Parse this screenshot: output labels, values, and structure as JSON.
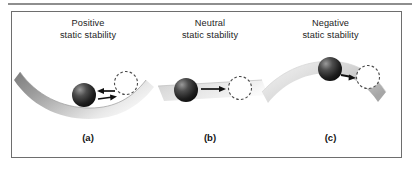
{
  "figure": {
    "kind": "static-stability-diagram",
    "background_color": "#ffffff",
    "frame_border_color": "#6e6e6e",
    "rule_color": "#8e8e8e",
    "panels": [
      {
        "id": "a",
        "caption": "(a)",
        "title_line1": "Positive",
        "title_line2": "static stability",
        "surface_shape": "concave",
        "surface_label": "valley",
        "ball_position": "bottom-of-valley",
        "displaced_position": "up-right-slope",
        "arrows": [
          {
            "direction": "left",
            "meaning": "restoring-toward-equilibrium"
          },
          {
            "direction": "right",
            "meaning": "displacement-from-equilibrium"
          }
        ],
        "ball_color": "#141414",
        "ball_highlight_color": "#8a8a8a",
        "dashed_circle_color": "#4a4a4a",
        "arrow_color": "#111111"
      },
      {
        "id": "b",
        "caption": "(b)",
        "title_line1": "Neutral",
        "title_line2": "static stability",
        "surface_shape": "flat",
        "surface_label": "level plane",
        "ball_position": "left",
        "displaced_position": "right",
        "arrows": [
          {
            "direction": "right",
            "meaning": "displacement-with-no-return"
          }
        ],
        "ball_color": "#141414",
        "ball_highlight_color": "#8a8a8a",
        "dashed_circle_color": "#4a4a4a",
        "arrow_color": "#111111"
      },
      {
        "id": "c",
        "caption": "(c)",
        "title_line1": "Negative",
        "title_line2": "static stability",
        "surface_shape": "convex",
        "surface_label": "hill",
        "ball_position": "near-crest",
        "displaced_position": "down-right-slope",
        "arrows": [
          {
            "direction": "right",
            "meaning": "divergence-away-from-equilibrium"
          }
        ],
        "ball_color": "#141414",
        "ball_highlight_color": "#8a8a8a",
        "dashed_circle_color": "#4a4a4a",
        "arrow_color": "#111111"
      }
    ]
  }
}
